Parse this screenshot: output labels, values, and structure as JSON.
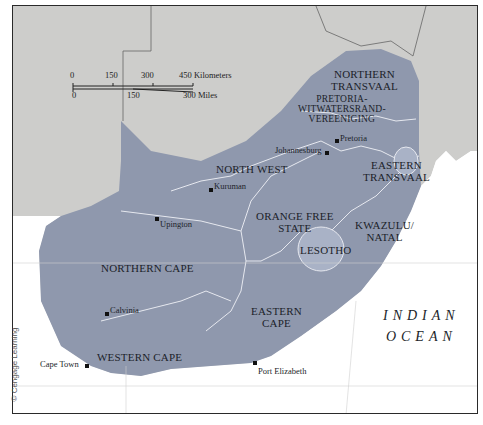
{
  "map": {
    "title": "South Africa Provinces",
    "colors": {
      "province_fill": "#8f98ad",
      "neighbor_fill": "#cdcdcb",
      "ocean": "#ffffff",
      "border": "#2a2a2a",
      "internal_border": "#e6e8ef",
      "lesotho_fill": "#a9b2c6"
    },
    "provinces": [
      {
        "name": "NORTHERN TRANSVAAL",
        "line1": "NORTHERN",
        "line2": "TRANSVAAL"
      },
      {
        "name": "PRETORIA-WITWATERSRAND-VEREENIGING",
        "line1": "PRETORIA-",
        "line2": "WITWATERSRAND-",
        "line3": "VEREENIGING"
      },
      {
        "name": "EASTERN TRANSVAAL",
        "line1": "EASTERN",
        "line2": "TRANSVAAL"
      },
      {
        "name": "NORTH WEST",
        "line1": "NORTH WEST"
      },
      {
        "name": "ORANGE FREE STATE",
        "line1": "ORANGE FREE",
        "line2": "STATE"
      },
      {
        "name": "KWAZULU/NATAL",
        "line1": "KWAZULU/",
        "line2": "NATAL"
      },
      {
        "name": "LESOTHO",
        "line1": "LESOTHO"
      },
      {
        "name": "NORTHERN CAPE",
        "line1": "NORTHERN CAPE"
      },
      {
        "name": "EASTERN CAPE",
        "line1": "EASTERN",
        "line2": "CAPE"
      },
      {
        "name": "WESTERN CAPE",
        "line1": "WESTERN CAPE"
      }
    ],
    "cities": [
      {
        "name": "Pretoria"
      },
      {
        "name": "Johannesburg"
      },
      {
        "name": "Kuruman"
      },
      {
        "name": "Upington"
      },
      {
        "name": "Calvinia"
      },
      {
        "name": "Cape Town"
      },
      {
        "name": "Port Elizabeth"
      }
    ],
    "ocean": {
      "line1": "INDIAN",
      "line2": "OCEAN"
    },
    "scale": {
      "km_ticks": [
        "0",
        "150",
        "300",
        "450 Kilometers"
      ],
      "mi_ticks": [
        "0",
        "150",
        "300 Miles"
      ]
    },
    "credit": "© Cengage Learning"
  }
}
